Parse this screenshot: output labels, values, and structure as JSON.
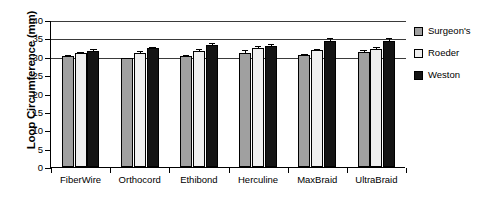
{
  "chart_data": {
    "type": "bar",
    "title": "",
    "xlabel": "",
    "ylabel": "Loop Circumference (mm)",
    "ylim": [
      0,
      40
    ],
    "ytick_labels": [
      "0",
      "5",
      "10",
      "15",
      "20",
      "25",
      "30",
      "35",
      "40"
    ],
    "ytick_values": [
      0,
      5,
      10,
      15,
      20,
      25,
      30,
      35,
      40
    ],
    "grid": "horizontal gridlines at 30, 35, 40",
    "gridline_values": [
      30,
      35,
      40
    ],
    "legend_position": "right",
    "categories": [
      "FiberWire",
      "Orthocord",
      "Ethibond",
      "Herculine",
      "MaxBraid",
      "UltraBraid"
    ],
    "series": [
      {
        "name": "Surgeon's",
        "color": "#a0a0a0",
        "values": [
          30.3,
          29.6,
          30.2,
          31.0,
          30.4,
          31.3
        ],
        "errors": [
          0.5,
          0.4,
          0.5,
          1.0,
          0.5,
          0.8
        ]
      },
      {
        "name": "Roeder",
        "color": "#efefef",
        "values": [
          31.1,
          31.0,
          31.6,
          32.3,
          31.8,
          32.1
        ],
        "errors": [
          0.4,
          0.9,
          0.7,
          0.9,
          0.5,
          0.7
        ]
      },
      {
        "name": "Weston",
        "color": "#141414",
        "values": [
          31.6,
          32.4,
          33.3,
          32.9,
          34.3,
          34.4
        ],
        "errors": [
          0.9,
          0.5,
          0.7,
          0.8,
          1.0,
          1.1
        ]
      }
    ]
  },
  "legend": {
    "items": [
      {
        "label": "Surgeon's"
      },
      {
        "label": "Roeder"
      },
      {
        "label": "Weston"
      }
    ]
  }
}
